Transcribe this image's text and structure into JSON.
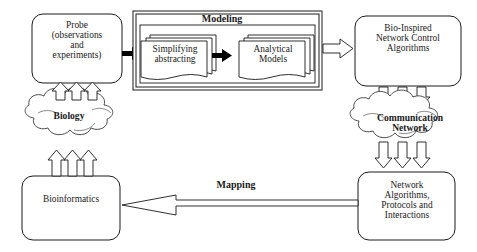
{
  "diagram": {
    "colors": {
      "stroke": "#1a1a1a",
      "fill": "#ffffff",
      "text": "#1a1a1a",
      "arrow_solid": "#000000"
    },
    "nodes": {
      "probe": {
        "label": "Probe\n(observations\nand\nexperiments)",
        "shape": "rounded-rectangle"
      },
      "modeling_group": {
        "label": "Modeling",
        "shape": "double-border-rectangle"
      },
      "simplifying": {
        "label": "Simplifying\nabstracting",
        "shape": "stacked-documents"
      },
      "analytical": {
        "label": "Analytical\nModels",
        "shape": "stacked-documents"
      },
      "bio_inspired": {
        "label": "Bio-Inspired\nNetwork Control\nAlgorithms",
        "shape": "rounded-rectangle"
      },
      "biology": {
        "label": "Biology",
        "shape": "cloud"
      },
      "communication_network": {
        "label": "Communication\nNetwork",
        "shape": "cloud"
      },
      "bioinformatics": {
        "label": "Bioinformatics",
        "shape": "rounded-rectangle"
      },
      "network_algorithms": {
        "label": "Network\nAlgorithms,\nProtocols and\nInteractions",
        "shape": "rounded-rectangle"
      }
    },
    "edges": {
      "mapping": {
        "label": "Mapping",
        "style": "hollow-arrow",
        "direction": "right-to-left",
        "from": "network_algorithms",
        "to": "bioinformatics"
      },
      "probe_to_modeling": {
        "label": "",
        "style": "solid-arrow",
        "direction": "left-to-right"
      },
      "simplify_to_analytical": {
        "label": "",
        "style": "solid-arrow",
        "direction": "left-to-right"
      },
      "modeling_to_bioinspired": {
        "label": "",
        "style": "hollow-arrow",
        "direction": "left-to-right"
      },
      "biology_to_probe": {
        "label": "",
        "style": "triple-hollow-arrow",
        "direction": "upward"
      },
      "bioinformatics_to_biology": {
        "label": "",
        "style": "triple-hollow-arrow",
        "direction": "upward"
      },
      "bioinspired_to_commnet": {
        "label": "",
        "style": "triple-hollow-arrow",
        "direction": "downward"
      },
      "commnet_to_netalgo": {
        "label": "",
        "style": "triple-hollow-arrow",
        "direction": "downward"
      }
    }
  }
}
